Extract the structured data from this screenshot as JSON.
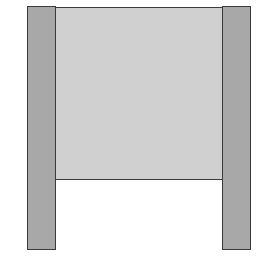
{
  "diagram": {
    "colors": {
      "post_fill": "#a8a8a8",
      "panel_fill": "#d0d0d0",
      "outline": "#3a3a3a",
      "background": "#ffffff"
    },
    "shapes": {
      "left_post": {
        "x": 27,
        "y": 6,
        "w": 29,
        "h": 244
      },
      "right_post": {
        "x": 222,
        "y": 6,
        "w": 29,
        "h": 244
      },
      "panel": {
        "x": 55,
        "y": 7,
        "w": 168,
        "h": 173
      }
    },
    "caption": ""
  }
}
